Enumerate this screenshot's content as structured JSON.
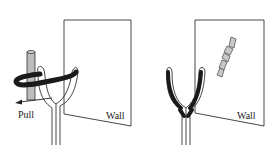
{
  "panels": [
    {
      "id": "left",
      "wall_label": "Wall",
      "action_label": "Pull",
      "objects": [
        "wall",
        "slingshot-fork",
        "vertical-rod",
        "rubber-band-loop",
        "pull-arrow"
      ]
    },
    {
      "id": "right",
      "wall_label": "Wall",
      "objects": [
        "wall",
        "slingshot-fork",
        "broken-rod-fragments"
      ]
    }
  ],
  "colors": {
    "line": "#333333",
    "band": "#1a1a1a",
    "rod_fill": "#bdbdbd",
    "fragment_fill": "#c8c8c8",
    "background": "#ffffff"
  }
}
